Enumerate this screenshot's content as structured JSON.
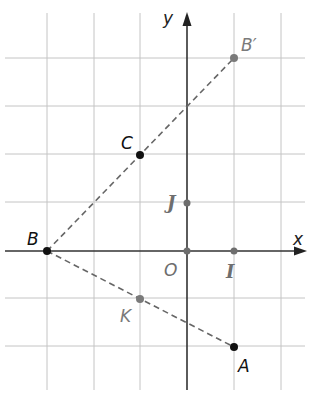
{
  "figure": {
    "grid": {
      "spacing_px": 47,
      "origin_px": [
        187,
        251
      ],
      "x_range": [
        -3.9,
        2.5
      ],
      "y_range": [
        -3.0,
        5.0
      ],
      "vertical_lines_x": [
        -3,
        -2,
        -1,
        1,
        2
      ],
      "horizontal_lines_y": [
        4,
        3,
        2,
        1,
        -1,
        -2
      ],
      "color": "#bdbdbd"
    },
    "axes": {
      "x_label": "x",
      "y_label": "y",
      "color": "#333333"
    },
    "points": [
      {
        "id": "B",
        "label": "B",
        "x": -3,
        "y": 0,
        "color": "#111111"
      },
      {
        "id": "Bprime",
        "label": "B′",
        "x": 1,
        "y": 4,
        "color": "#7a7a7a"
      },
      {
        "id": "C",
        "label": "C",
        "x": -1,
        "y": 2,
        "color": "#111111"
      },
      {
        "id": "J",
        "label": "J",
        "x": 0,
        "y": 1,
        "color": "#7a7a7a"
      },
      {
        "id": "O",
        "label": "O",
        "x": 0,
        "y": 0,
        "color": "#7a7a7a"
      },
      {
        "id": "I",
        "label": "I",
        "x": 1,
        "y": 0,
        "color": "#7a7a7a"
      },
      {
        "id": "K",
        "label": "K",
        "x": -1,
        "y": -1,
        "color": "#7a7a7a"
      },
      {
        "id": "A",
        "label": "A",
        "x": 1,
        "y": -2,
        "color": "#111111"
      }
    ],
    "segments": [
      {
        "from": "B",
        "to": "Bprime",
        "style": "dashed",
        "color": "#666666"
      },
      {
        "from": "B",
        "to": "A",
        "style": "dashed",
        "color": "#666666"
      }
    ],
    "labels": {
      "B": "B",
      "Bprime": "B′",
      "C": "C",
      "J": "J",
      "O": "O",
      "I": "I",
      "K": "K",
      "A": "A",
      "x": "x",
      "y": "y"
    }
  }
}
